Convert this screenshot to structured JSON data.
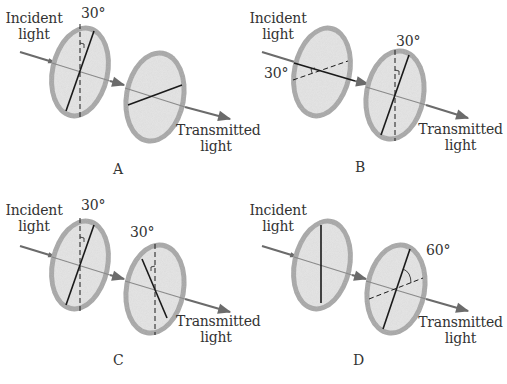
{
  "figure": {
    "colors": {
      "rim": "#a8a8a8",
      "disc": "#e4e4e4",
      "line": "#1a1a1a",
      "arrow": "#6b6b6b",
      "text": "#333333"
    },
    "panels": [
      {
        "id": "A",
        "letter": "A",
        "incident_label_line1": "Incident",
        "incident_label_line2": "light",
        "transmitted_label_line1": "Transmitted",
        "transmitted_label_line2": "light",
        "angle_labels": [
          "30°"
        ],
        "polarizer1": {
          "axis": "30° from vertical",
          "reference": "vertical dashed"
        },
        "polarizer2": {
          "axis": "perpendicular to polarizer 1 (crossed)"
        }
      },
      {
        "id": "B",
        "letter": "B",
        "incident_label_line1": "Incident",
        "incident_label_line2": "light",
        "transmitted_label_line1": "Transmitted",
        "transmitted_label_line2": "light",
        "angle_labels": [
          "30°",
          "30°"
        ],
        "polarizer1": {
          "axis": "near horizontal",
          "reference": "dashed at 30°"
        },
        "polarizer2": {
          "axis": "30° from vertical",
          "reference": "vertical dashed"
        }
      },
      {
        "id": "C",
        "letter": "C",
        "incident_label_line1": "Incident",
        "incident_label_line2": "light",
        "transmitted_label_line1": "Transmitted",
        "transmitted_label_line2": "light",
        "angle_labels": [
          "30°",
          "30°"
        ],
        "polarizer1": {
          "axis": "30° clockwise from vertical",
          "reference": "vertical dashed"
        },
        "polarizer2": {
          "axis": "30° counterclockwise from vertical",
          "reference": "vertical dashed"
        }
      },
      {
        "id": "D",
        "letter": "D",
        "incident_label_line1": "Incident",
        "incident_label_line2": "light",
        "transmitted_label_line1": "Transmitted",
        "transmitted_label_line2": "light",
        "angle_labels": [
          "60°"
        ],
        "polarizer1": {
          "axis": "vertical"
        },
        "polarizer2": {
          "axis": "tilted 60° from dashed reference"
        }
      }
    ]
  }
}
